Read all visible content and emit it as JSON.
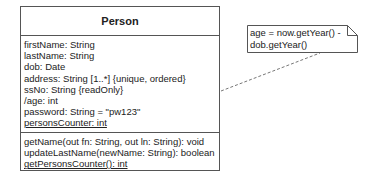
{
  "class": {
    "name": "Person",
    "attributes": [
      {
        "text": "firstName: String",
        "static": false
      },
      {
        "text": "lastName: String",
        "static": false
      },
      {
        "text": "dob: Date",
        "static": false
      },
      {
        "text": "address: String [1..*] {unique, ordered}",
        "static": false
      },
      {
        "text": "ssNo: String {readOnly}",
        "static": false
      },
      {
        "text": "/age: int",
        "static": false
      },
      {
        "text": "password: String = \"pw123\"",
        "static": false
      },
      {
        "text": "personsCounter: int",
        "static": true
      }
    ],
    "operations": [
      {
        "text": "getName(out fn: String, out ln: String): void",
        "static": false
      },
      {
        "text": "updateLastName(newName: String): boolean",
        "static": false
      },
      {
        "text": "getPersonsCounter(): int",
        "static": true
      }
    ]
  },
  "note": {
    "line1": "age = now.getYear() -",
    "line2": "dob.getYear()"
  },
  "colors": {
    "border": "#555555",
    "text": "#222222",
    "dash": "#777777"
  }
}
